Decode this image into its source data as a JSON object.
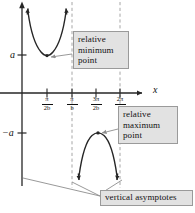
{
  "figure": {
    "kind": "math-graph",
    "axes": {
      "x_axis_label": "x",
      "y_axis_positive_label": "a",
      "y_axis_negative_label": "−a",
      "x_ticks": [
        {
          "numerator": "π",
          "denominator": "2b"
        },
        {
          "numerator": "π",
          "denominator": "b"
        },
        {
          "numerator": "3π",
          "denominator": "2b"
        },
        {
          "numerator": "2π",
          "denominator": "b"
        }
      ]
    },
    "callouts": {
      "minimum": {
        "line1": "relative",
        "line2": "minimum",
        "line3": "point"
      },
      "maximum": {
        "line1": "relative",
        "line2": "maximum",
        "line3": "point"
      },
      "asymptotes": {
        "line1": "vertical asymptotes"
      }
    },
    "colors": {
      "curve": "#262626",
      "axis": "#262626",
      "asymptote": "#9c9c9c",
      "callout_fill": "#e2e2e2",
      "callout_border": "#9a9a9a",
      "leader": "#8d8d8d",
      "text": "#111111"
    }
  }
}
